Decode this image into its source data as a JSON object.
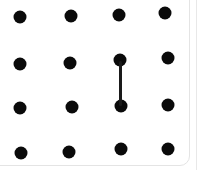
{
  "game": {
    "type": "dots-and-boxes",
    "grid": {
      "rows": 4,
      "cols": 4
    },
    "dots": [
      {
        "r": 0,
        "c": 0,
        "x": 20,
        "y": 17
      },
      {
        "r": 0,
        "c": 1,
        "x": 71,
        "y": 16
      },
      {
        "r": 0,
        "c": 2,
        "x": 119,
        "y": 15
      },
      {
        "r": 0,
        "c": 3,
        "x": 165,
        "y": 13
      },
      {
        "r": 1,
        "c": 0,
        "x": 20,
        "y": 64
      },
      {
        "r": 1,
        "c": 1,
        "x": 70,
        "y": 63
      },
      {
        "r": 1,
        "c": 2,
        "x": 120,
        "y": 60
      },
      {
        "r": 1,
        "c": 3,
        "x": 168,
        "y": 58
      },
      {
        "r": 2,
        "c": 0,
        "x": 20,
        "y": 108
      },
      {
        "r": 2,
        "c": 1,
        "x": 72,
        "y": 107
      },
      {
        "r": 2,
        "c": 2,
        "x": 121,
        "y": 106
      },
      {
        "r": 2,
        "c": 3,
        "x": 168,
        "y": 105
      },
      {
        "r": 3,
        "c": 0,
        "x": 21,
        "y": 153
      },
      {
        "r": 3,
        "c": 1,
        "x": 69,
        "y": 152
      },
      {
        "r": 3,
        "c": 2,
        "x": 121,
        "y": 149
      },
      {
        "r": 3,
        "c": 3,
        "x": 168,
        "y": 149
      }
    ],
    "lines": [
      {
        "orientation": "v",
        "from": {
          "r": 1,
          "c": 2
        },
        "to": {
          "r": 2,
          "c": 2
        },
        "x": 120,
        "y1": 61,
        "y2": 106
      }
    ],
    "colors": {
      "dot": "#0a0a0a",
      "line": "#1a1a1a",
      "background": "#ffffff",
      "border": "#e4e4e4"
    }
  }
}
